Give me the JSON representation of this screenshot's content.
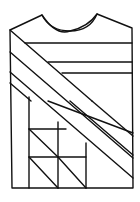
{
  "diagram": {
    "stroke_color": "#111111",
    "background": "#ffffff",
    "outline": {
      "left_shoulder": [
        10,
        30
      ],
      "neck_left": [
        42,
        15
      ],
      "neck_bottom": [
        70,
        31
      ],
      "neck_right": [
        97,
        14
      ],
      "right_shoulder": [
        132,
        28
      ],
      "bottom_left": [
        12,
        188
      ],
      "bottom_right": [
        133,
        188
      ]
    },
    "horizontal_stripes_y": [
      43,
      62,
      73
    ],
    "diagonal_bands_count": 4,
    "triangle_grid": {
      "rows": 2,
      "cols": 3,
      "cell_size": 28
    }
  }
}
